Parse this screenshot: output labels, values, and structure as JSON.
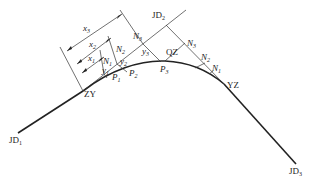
{
  "diagram": {
    "type": "circular curve offset (tangent) method layout",
    "points": {
      "jd1": {
        "main": "JD",
        "sub": "1"
      },
      "jd2": {
        "main": "JD",
        "sub": "2"
      },
      "jd3": {
        "main": "JD",
        "sub": "3"
      },
      "zy": "ZY",
      "qz": "QZ",
      "yz": "YZ"
    },
    "curve_points": [
      {
        "main": "P",
        "sub": "1"
      },
      {
        "main": "P",
        "sub": "2"
      },
      {
        "main": "P",
        "sub": "3"
      }
    ],
    "tangent_feet_left": [
      {
        "main": "N",
        "sub": "1"
      },
      {
        "main": "N",
        "sub": "2"
      },
      {
        "main": "N",
        "sub": "3"
      }
    ],
    "tangent_feet_right": [
      {
        "main": "N",
        "sub": "1"
      },
      {
        "main": "N",
        "sub": "2"
      },
      {
        "main": "N",
        "sub": "3"
      }
    ],
    "x_distances": [
      {
        "main": "x",
        "sub": "1"
      },
      {
        "main": "x",
        "sub": "2"
      },
      {
        "main": "x",
        "sub": "3"
      }
    ],
    "y_offsets": [
      {
        "main": "y",
        "sub": "1"
      },
      {
        "main": "y",
        "sub": "2"
      },
      {
        "main": "y",
        "sub": "3"
      }
    ],
    "colors": {
      "line": "#222222",
      "background": "#ffffff"
    }
  }
}
